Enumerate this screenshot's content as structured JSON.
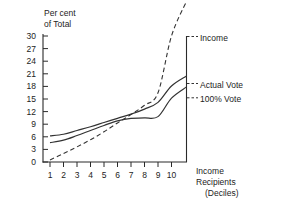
{
  "chart_data": {
    "type": "line",
    "title": "",
    "ylabel": "Per cent\nof Total",
    "ylabel_line1": "Per cent",
    "ylabel_line2": "of Total",
    "xlabel_line1": "Income",
    "xlabel_line2": "Recipients",
    "xlabel_line3": "(Deciles)",
    "x": [
      1,
      2,
      3,
      4,
      5,
      6,
      7,
      8,
      9,
      10
    ],
    "categories": [
      "1",
      "2",
      "3",
      "4",
      "5",
      "6",
      "7",
      "8",
      "9",
      "10"
    ],
    "yticks": [
      0,
      3,
      6,
      9,
      12,
      15,
      18,
      21,
      24,
      27,
      30
    ],
    "ylim": [
      0,
      31
    ],
    "xlim": [
      0.45,
      10.6
    ],
    "grid": false,
    "legend_position": "right-inline",
    "series": [
      {
        "name": "Income",
        "style": "dashed",
        "color": "#333333",
        "values": [
          0.5,
          2.0,
          3.6,
          5.3,
          7.2,
          9.3,
          11.3,
          13.5,
          16.5,
          30.0
        ]
      },
      {
        "name": "Actual Vote",
        "style": "solid",
        "color": "#333333",
        "values": [
          6.2,
          6.6,
          7.5,
          8.4,
          9.4,
          10.4,
          11.4,
          12.6,
          14.2,
          18.1
        ]
      },
      {
        "name": "100% Vote",
        "style": "solid",
        "color": "#333333",
        "values": [
          4.6,
          5.2,
          6.3,
          7.5,
          8.7,
          9.8,
          10.4,
          10.5,
          10.8,
          15.2
        ]
      }
    ]
  },
  "axis": {
    "ytick_labels": [
      "30",
      "27",
      "24",
      "21",
      "18",
      "15",
      "12",
      "9",
      "6",
      "3",
      "0"
    ],
    "xtick_labels": [
      "1",
      "2",
      "3",
      "4",
      "5",
      "6",
      "7",
      "8",
      "9",
      "10"
    ]
  }
}
